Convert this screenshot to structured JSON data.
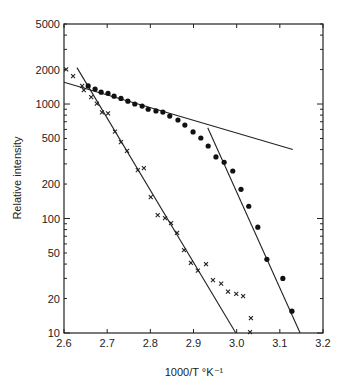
{
  "chart_data": {
    "type": "scatter",
    "title": "",
    "xlabel": "1000/T °K⁻¹",
    "ylabel": "Relative intensity",
    "xlim": [
      2.6,
      3.2
    ],
    "ylim": [
      10,
      5000
    ],
    "yscale": "log",
    "grid": false,
    "legend": null,
    "x_ticks": [
      "2.6",
      "2.7",
      "2.8",
      "2.9",
      "3.0",
      "3.1",
      "3.2"
    ],
    "y_ticks": [
      "10",
      "20",
      "50",
      "100",
      "200",
      "500",
      "1000",
      "2000",
      "5000"
    ],
    "series": [
      {
        "name": "dots",
        "marker": "filled-circle",
        "x": [
          2.656,
          2.672,
          2.686,
          2.702,
          2.716,
          2.732,
          2.748,
          2.764,
          2.781,
          2.795,
          2.813,
          2.829,
          2.845,
          2.864,
          2.88,
          2.899,
          2.917,
          2.934,
          2.952,
          2.971,
          2.991,
          3.01,
          3.028,
          3.049,
          3.07,
          3.107,
          3.128
        ],
        "y": [
          1440,
          1350,
          1270,
          1240,
          1170,
          1120,
          1060,
          1000,
          960,
          900,
          870,
          850,
          785,
          725,
          655,
          570,
          505,
          430,
          345,
          310,
          260,
          180,
          128,
          84,
          44,
          30,
          15.5
        ]
      },
      {
        "name": "crosses",
        "marker": "x",
        "x": [
          2.605,
          2.621,
          2.642,
          2.646,
          2.663,
          2.676,
          2.688,
          2.702,
          2.718,
          2.732,
          2.746,
          2.771,
          2.785,
          2.801,
          2.817,
          2.834,
          2.848,
          2.862,
          2.878,
          2.894,
          2.91,
          2.929,
          2.945,
          2.964,
          2.98,
          2.999,
          3.015,
          3.033,
          3.031
        ],
        "y": [
          2010,
          1750,
          1440,
          1320,
          1150,
          1010,
          845,
          830,
          575,
          465,
          390,
          265,
          275,
          154,
          107,
          101,
          91,
          75,
          53,
          41,
          35,
          40,
          29,
          27,
          23,
          22,
          21,
          13.5,
          10.2
        ]
      }
    ],
    "fit_lines": [
      {
        "name": "crosses-fit",
        "x": [
          2.63,
          2.998
        ],
        "y": [
          2080,
          10
        ]
      },
      {
        "name": "dots-shallow-fit",
        "x": [
          2.6,
          3.13
        ],
        "y": [
          1550,
          400
        ]
      },
      {
        "name": "dots-steep-fit",
        "x": [
          2.933,
          3.147
        ],
        "y": [
          620,
          10
        ]
      }
    ]
  }
}
